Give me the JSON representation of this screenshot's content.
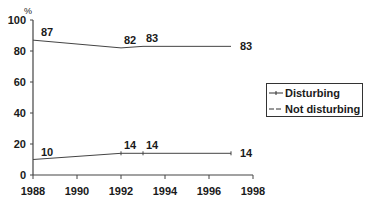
{
  "chart_data": {
    "type": "line",
    "title": "",
    "xlabel": "",
    "ylabel": "%",
    "xlim": [
      1988,
      1998
    ],
    "ylim": [
      0,
      100
    ],
    "x_ticks": [
      "1988",
      "1990",
      "1992",
      "1994",
      "1996",
      "1998"
    ],
    "y_ticks": [
      "0",
      "20",
      "40",
      "60",
      "80",
      "100"
    ],
    "grid": false,
    "legend_position": "right",
    "series": [
      {
        "name": "Disturbing",
        "x": [
          1988,
          1992,
          1993,
          1997
        ],
        "values": [
          10,
          14,
          14,
          14
        ],
        "labels": [
          "10",
          "14",
          "14",
          "14"
        ]
      },
      {
        "name": "Not disturbing",
        "x": [
          1988,
          1992,
          1993,
          1997
        ],
        "values": [
          87,
          82,
          83,
          83
        ],
        "labels": [
          "87",
          "82",
          "83",
          "83"
        ]
      }
    ]
  },
  "legend": {
    "items": [
      {
        "label": "Disturbing"
      },
      {
        "label": "Not disturbing"
      }
    ]
  },
  "axis": {
    "y_unit": "%"
  }
}
